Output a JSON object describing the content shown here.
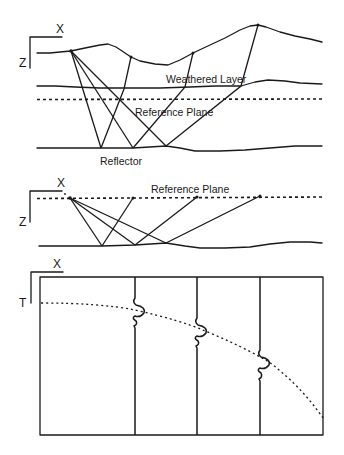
{
  "panel1": {
    "axis_x_label": "X",
    "axis_z_label": "Z",
    "weathered_layer_label": "Weathered Layer",
    "reference_plane_label": "Reference Plane",
    "reflector_label": "Reflector"
  },
  "panel2": {
    "axis_x_label": "X",
    "axis_z_label": "Z",
    "reference_plane_label": "Reference Plane"
  },
  "panel3": {
    "axis_x_label": "X",
    "axis_t_label": "T",
    "trace_count": 3
  },
  "colors": {
    "ink": "#1a1a1a",
    "background": "#ffffff"
  }
}
